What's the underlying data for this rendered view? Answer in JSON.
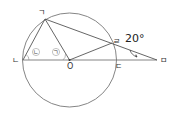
{
  "diagram": {
    "type": "circle-geometry",
    "circle": {
      "center_label": "O",
      "cx": 69.5,
      "cy": 60,
      "r": 47
    },
    "points": [
      {
        "id": "giyeok",
        "label": "ㄱ",
        "x": 45,
        "y": 19
      },
      {
        "id": "nieun",
        "label": "ㄴ",
        "x": 23,
        "y": 60
      },
      {
        "id": "o",
        "label": "O",
        "x": 69.5,
        "y": 60
      },
      {
        "id": "digeut",
        "label": "ㄷ",
        "x": 116,
        "y": 60
      },
      {
        "id": "rieul",
        "label": "ㄹ",
        "x": 112,
        "y": 43
      },
      {
        "id": "mieum",
        "label": "ㅁ",
        "x": 157,
        "y": 60
      }
    ],
    "angle_markers": [
      {
        "id": "angle-nieun",
        "label": "ㄴ"
      },
      {
        "id": "angle-giyeok",
        "label": "ㄱ"
      }
    ],
    "given_angle": {
      "value": "20°",
      "at": "ㅁ"
    }
  }
}
